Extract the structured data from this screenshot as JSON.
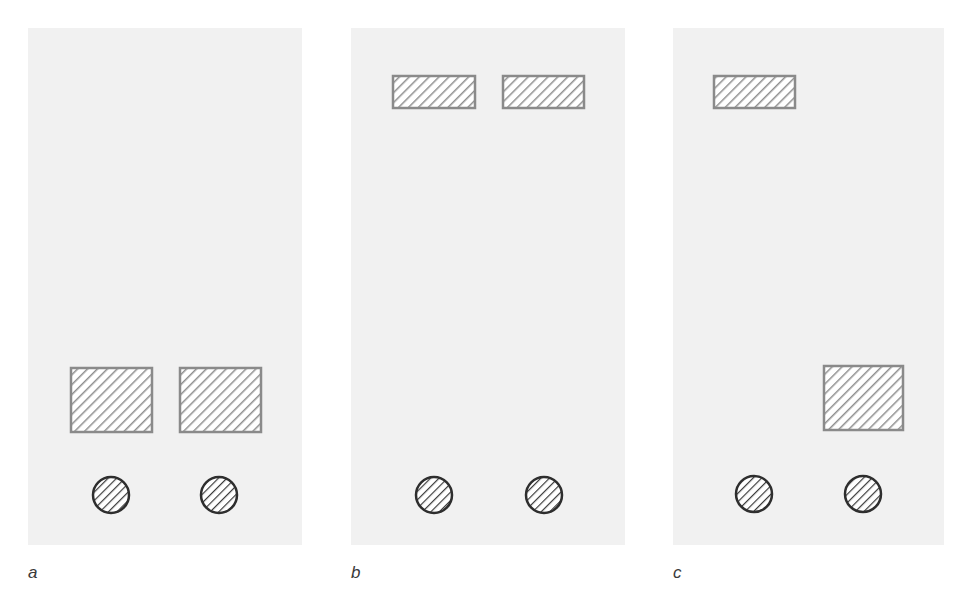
{
  "figure": {
    "width": 966,
    "height": 593,
    "colors": {
      "panel_bg": "#f1f1f1",
      "rect_stroke": "#8a8a8a",
      "rect_hatch": "#8f8f8f",
      "circle_stroke": "#2e2e2e",
      "circle_hatch": "#3a3a3a",
      "label": "#3a3a3a"
    },
    "panels": [
      {
        "id": "a",
        "label": "a",
        "box": {
          "x": 28,
          "y": 28,
          "w": 274,
          "h": 517
        },
        "label_pos": {
          "x": 28,
          "y": 578
        },
        "rects": [
          {
            "x": 71,
            "y": 368,
            "w": 81,
            "h": 64
          },
          {
            "x": 180,
            "y": 368,
            "w": 81,
            "h": 64
          }
        ],
        "circles": [
          {
            "cx": 111,
            "cy": 495,
            "r": 18
          },
          {
            "cx": 219,
            "cy": 495,
            "r": 18
          }
        ]
      },
      {
        "id": "b",
        "label": "b",
        "box": {
          "x": 351,
          "y": 28,
          "w": 274,
          "h": 517
        },
        "label_pos": {
          "x": 351,
          "y": 578
        },
        "rects": [
          {
            "x": 393,
            "y": 76,
            "w": 82,
            "h": 32
          },
          {
            "x": 503,
            "y": 76,
            "w": 81,
            "h": 32
          }
        ],
        "circles": [
          {
            "cx": 434,
            "cy": 495,
            "r": 18
          },
          {
            "cx": 544,
            "cy": 495,
            "r": 18
          }
        ]
      },
      {
        "id": "c",
        "label": "c",
        "box": {
          "x": 673,
          "y": 28,
          "w": 271,
          "h": 517
        },
        "label_pos": {
          "x": 673,
          "y": 578
        },
        "rects": [
          {
            "x": 714,
            "y": 76,
            "w": 81,
            "h": 32
          },
          {
            "x": 824,
            "y": 366,
            "w": 79,
            "h": 64
          }
        ],
        "circles": [
          {
            "cx": 754,
            "cy": 494,
            "r": 18
          },
          {
            "cx": 863,
            "cy": 494,
            "r": 18
          }
        ]
      }
    ]
  }
}
